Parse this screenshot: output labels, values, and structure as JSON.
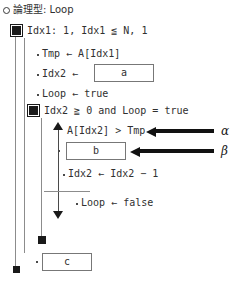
{
  "diagram": {
    "title_line": "論理型: Loop",
    "title_marker": "circle-open-marker",
    "rows": [
      {
        "id": "loop_header",
        "text": "Idx1: 1, Idx1 ≦ N, 1",
        "marker": "filled-square-marker"
      },
      {
        "id": "stmt_tmp",
        "text": "Tmp ← A[Idx1]",
        "marker": "bullet-dot"
      },
      {
        "id": "stmt_idx2_prefix",
        "text": "Idx2 ←",
        "marker": "bullet-dot"
      },
      {
        "id": "stmt_loop_true",
        "text": "Loop ← true",
        "marker": "bullet-dot"
      },
      {
        "id": "while_header",
        "text": "Idx2 ≧ 0  and  Loop = true",
        "marker": "filled-square-marker"
      },
      {
        "id": "cond_a",
        "text": "A[Idx2] > Tmp",
        "marker": "triangle-up-marker"
      },
      {
        "id": "stmt_b_prefix",
        "text": "",
        "marker": "bullet-dot"
      },
      {
        "id": "stmt_idx2_dec",
        "text": "Idx2 ← Idx2 − 1",
        "marker": "bullet-dot"
      },
      {
        "id": "stmt_loop_false",
        "text": "Loop ← false",
        "marker": "bullet-dot"
      },
      {
        "id": "stmt_c_prefix",
        "text": "",
        "marker": "bullet-dot"
      }
    ],
    "boxes": [
      {
        "id": "box_a",
        "value": "a"
      },
      {
        "id": "box_b",
        "value": "b"
      },
      {
        "id": "box_c",
        "value": "c"
      }
    ],
    "annotations": [
      {
        "id": "annotation_alpha",
        "label": "α"
      },
      {
        "id": "annotation_beta",
        "label": "β"
      }
    ],
    "colors": {
      "text": "#303030",
      "rail": "#8c8c8c",
      "marker": "#1a1a1a",
      "box_border": "#777777",
      "arrow": "#111111"
    }
  }
}
